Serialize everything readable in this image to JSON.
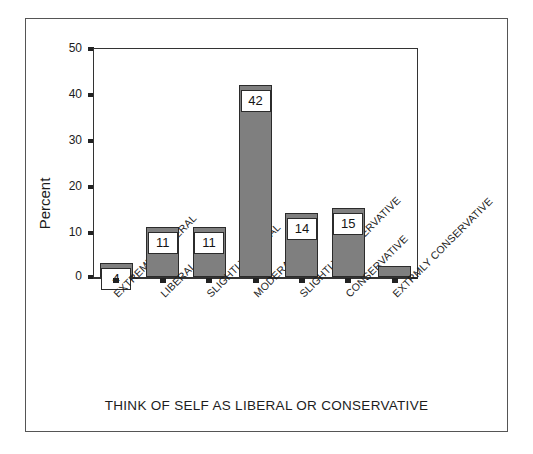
{
  "chart_data": {
    "type": "bar",
    "title": "",
    "xlabel": "THINK OF SELF AS LIBERAL OR CONSERVATIVE",
    "ylabel": "Percent",
    "ylim": [
      0,
      50
    ],
    "yticks": [
      0,
      10,
      20,
      30,
      40,
      50
    ],
    "grid": false,
    "legend": null,
    "categories": [
      "EXTREMELY LIBERAL",
      "LIBERAL",
      "SLIGHTLY LIBERAL",
      "MODERATE",
      "SLIGHTLY CONSERVATIVE",
      "CONSERVATIVE",
      "EXTRMLY CONSERVATIVE"
    ],
    "values": [
      3,
      11,
      11,
      42,
      14,
      15,
      2.5
    ],
    "data_labels": [
      "4",
      "11",
      "11",
      "42",
      "14",
      "15",
      ""
    ],
    "bar_color": "#7f7f7f",
    "bar_edge_color": "#2b2b2b",
    "label_box_color": "#ffffff",
    "axis_color": "#333333",
    "background": "#ffffff"
  },
  "axis": {
    "y_tick_labels": [
      "50",
      "40",
      "30",
      "20",
      "10",
      "0"
    ]
  }
}
